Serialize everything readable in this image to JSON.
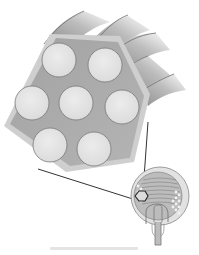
{
  "figure": {
    "colors": {
      "background": "#ffffff",
      "hexagon_fill": "#a9a9a9",
      "hexagon_halo": "#cdcdcd",
      "fiber_fill": "#e6e6e6",
      "fiber_stroke": "#7a7a7a",
      "tube_shade": "#9a9a9a",
      "leader_line": "#333333",
      "inset_outer": "#d2d2d2",
      "inset_inner": "#bdbdbd"
    },
    "fibers": [
      {
        "id": "top-left",
        "cx": 59,
        "cy": 60,
        "r": 17
      },
      {
        "id": "top-right",
        "cx": 105,
        "cy": 65,
        "r": 17
      },
      {
        "id": "middle-left",
        "cx": 32,
        "cy": 103,
        "r": 17
      },
      {
        "id": "center",
        "cx": 76,
        "cy": 103,
        "r": 17
      },
      {
        "id": "middle-right",
        "cx": 122,
        "cy": 107,
        "r": 17
      },
      {
        "id": "bottom-left",
        "cx": 50,
        "cy": 145,
        "r": 17
      },
      {
        "id": "bottom-right",
        "cx": 94,
        "cy": 149,
        "r": 17
      }
    ],
    "fiber_count": 7,
    "caption": ""
  }
}
